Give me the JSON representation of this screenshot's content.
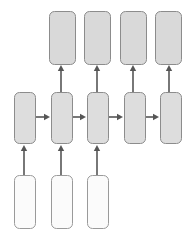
{
  "diagram": {
    "type": "flow-diagram",
    "canvas": {
      "width": 191,
      "height": 235,
      "background": "#ffffff"
    },
    "palette": {
      "output_fill": "#d9d9d9",
      "output_stroke": "#8c8c8c",
      "hidden_fill": "#dddddd",
      "hidden_stroke": "#8c8c8c",
      "input_fill": "#fbfbfb",
      "input_stroke": "#9a9a9a",
      "edge_color": "#565656"
    },
    "rows": [
      {
        "id": "output-row",
        "name": "output-row",
        "fill": "#d9d9d9",
        "stroke": "#8c8c8c",
        "corner_radius": 5,
        "nodes": [
          {
            "id": "output-1",
            "name": "output-node-1",
            "label": "",
            "x": 49,
            "y": 11,
            "w": 26,
            "h": 53
          },
          {
            "id": "output-2",
            "name": "output-node-2",
            "label": "",
            "x": 84,
            "y": 11,
            "w": 26,
            "h": 53
          },
          {
            "id": "output-3",
            "name": "output-node-3",
            "label": "",
            "x": 120,
            "y": 11,
            "w": 26,
            "h": 53
          },
          {
            "id": "output-4",
            "name": "output-node-4",
            "label": "",
            "x": 155,
            "y": 11,
            "w": 26,
            "h": 53
          }
        ]
      },
      {
        "id": "hidden-row",
        "name": "hidden-row",
        "fill": "#dddddd",
        "stroke": "#8c8c8c",
        "corner_radius": 5,
        "nodes": [
          {
            "id": "hidden-1",
            "name": "hidden-node-1",
            "label": "",
            "x": 14,
            "y": 92,
            "w": 21,
            "h": 51
          },
          {
            "id": "hidden-2",
            "name": "hidden-node-2",
            "label": "",
            "x": 51,
            "y": 92,
            "w": 21,
            "h": 51
          },
          {
            "id": "hidden-3",
            "name": "hidden-node-3",
            "label": "",
            "x": 87,
            "y": 92,
            "w": 21,
            "h": 51
          },
          {
            "id": "hidden-4",
            "name": "hidden-node-4",
            "label": "",
            "x": 124,
            "y": 92,
            "w": 21,
            "h": 51
          },
          {
            "id": "hidden-5",
            "name": "hidden-node-5",
            "label": "",
            "x": 160,
            "y": 92,
            "w": 21,
            "h": 51
          }
        ]
      },
      {
        "id": "input-row",
        "name": "input-row",
        "fill": "#fbfbfb",
        "stroke": "#9a9a9a",
        "corner_radius": 5,
        "nodes": [
          {
            "id": "input-1",
            "name": "input-node-1",
            "label": "",
            "x": 14,
            "y": 175,
            "w": 21,
            "h": 53
          },
          {
            "id": "input-2",
            "name": "input-node-2",
            "label": "",
            "x": 51,
            "y": 175,
            "w": 21,
            "h": 53
          },
          {
            "id": "input-3",
            "name": "input-node-3",
            "label": "",
            "x": 87,
            "y": 175,
            "w": 21,
            "h": 53
          }
        ]
      }
    ],
    "edges": [
      {
        "id": "edge-h1",
        "name": "recurrent-arrow-1",
        "from": "hidden-1",
        "to": "hidden-2",
        "orientation": "horizontal",
        "x1": 35,
        "y1": 117,
        "x2": 50,
        "y2": 117
      },
      {
        "id": "edge-h2",
        "name": "recurrent-arrow-2",
        "from": "hidden-2",
        "to": "hidden-3",
        "orientation": "horizontal",
        "x1": 72,
        "y1": 117,
        "x2": 86,
        "y2": 117
      },
      {
        "id": "edge-h3",
        "name": "recurrent-arrow-3",
        "from": "hidden-3",
        "to": "hidden-4",
        "orientation": "horizontal",
        "x1": 108,
        "y1": 117,
        "x2": 123,
        "y2": 117
      },
      {
        "id": "edge-h4",
        "name": "recurrent-arrow-4",
        "from": "hidden-4",
        "to": "hidden-5",
        "orientation": "horizontal",
        "x1": 145,
        "y1": 117,
        "x2": 159,
        "y2": 117
      },
      {
        "id": "edge-u1",
        "name": "output-arrow-1",
        "from": "hidden-2",
        "to": "output-1",
        "orientation": "vertical",
        "x1": 61,
        "y1": 92,
        "x2": 61,
        "y2": 65
      },
      {
        "id": "edge-u2",
        "name": "output-arrow-2",
        "from": "hidden-3",
        "to": "output-2",
        "orientation": "vertical",
        "x1": 97,
        "y1": 92,
        "x2": 97,
        "y2": 65
      },
      {
        "id": "edge-u3",
        "name": "output-arrow-3",
        "from": "hidden-4",
        "to": "output-3",
        "orientation": "vertical",
        "x1": 133,
        "y1": 92,
        "x2": 133,
        "y2": 65
      },
      {
        "id": "edge-u4",
        "name": "output-arrow-4",
        "from": "hidden-5",
        "to": "output-4",
        "orientation": "vertical",
        "x1": 169,
        "y1": 92,
        "x2": 169,
        "y2": 65
      },
      {
        "id": "edge-i1",
        "name": "input-arrow-1",
        "from": "input-1",
        "to": "hidden-1",
        "orientation": "vertical",
        "x1": 24,
        "y1": 175,
        "x2": 24,
        "y2": 145
      },
      {
        "id": "edge-i2",
        "name": "input-arrow-2",
        "from": "input-2",
        "to": "hidden-2",
        "orientation": "vertical",
        "x1": 61,
        "y1": 175,
        "x2": 61,
        "y2": 145
      },
      {
        "id": "edge-i3",
        "name": "input-arrow-3",
        "from": "input-3",
        "to": "hidden-3",
        "orientation": "vertical",
        "x1": 97,
        "y1": 175,
        "x2": 97,
        "y2": 145
      }
    ]
  }
}
